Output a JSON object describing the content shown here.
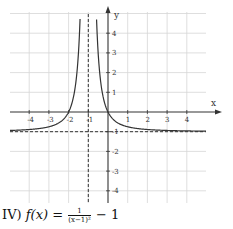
{
  "chart_data": {
    "type": "line",
    "title": "",
    "xlabel": "x",
    "ylabel": "y",
    "xlim": [
      -5,
      5
    ],
    "ylim": [
      -5,
      5
    ],
    "grid": true,
    "x_ticks": [
      -4,
      -3,
      -2,
      -1,
      1,
      2,
      3,
      4
    ],
    "y_ticks": [
      4,
      3,
      2,
      1,
      -1,
      -2,
      -3,
      -4
    ],
    "x_tick_labels": [
      "-4",
      "-3",
      "-2",
      "-1",
      "1",
      "2",
      "3",
      "4"
    ],
    "y_tick_labels": [
      "4",
      "3",
      "2",
      "1",
      "-1",
      "-2",
      "-3",
      "-4"
    ],
    "series": [
      {
        "name": "f(x)",
        "function": "1/(x+1)^2 - 1",
        "style": "solid",
        "color": "#333333",
        "key_points": [
          [
            -2,
            0
          ],
          [
            0,
            0
          ],
          [
            -3,
            -0.75
          ],
          [
            1,
            -0.75
          ],
          [
            -4,
            -0.889
          ],
          [
            4,
            -0.96
          ]
        ]
      }
    ],
    "asymptotes": [
      {
        "type": "vertical",
        "x": -1,
        "style": "dashed"
      },
      {
        "type": "horizontal",
        "y": -1,
        "style": "dashed"
      }
    ]
  },
  "caption": {
    "label": "IV)",
    "lhs": "f(x) =",
    "numerator": "1",
    "denominator": "(x−1)²",
    "rest": "− 1"
  }
}
